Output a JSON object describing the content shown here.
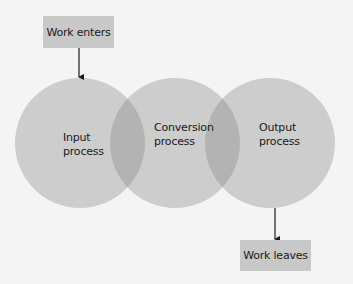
{
  "diagram": {
    "colors": {
      "background": "#f4f4f4",
      "circle_fill": "#cdcdcd",
      "overlap_fill": "#b3b3b3",
      "box_fill": "#c8c8c8",
      "arrow": "#1a1a1a",
      "text": "#1a1a1a"
    },
    "entry_box": {
      "label": "Work enters"
    },
    "exit_box": {
      "label": "Work leaves"
    },
    "circles": [
      {
        "id": "input",
        "line1": "Input",
        "line2": "process",
        "cx": 80,
        "cy": 143,
        "r": 65
      },
      {
        "id": "conversion",
        "line1": "Conversion",
        "line2": "process",
        "cx": 175,
        "cy": 143,
        "r": 65
      },
      {
        "id": "output",
        "line1": "Output",
        "line2": "process",
        "cx": 270,
        "cy": 143,
        "r": 65
      }
    ],
    "arrows": [
      {
        "from": "Work enters",
        "to": "Input process"
      },
      {
        "from": "Output process",
        "to": "Work leaves"
      }
    ]
  }
}
